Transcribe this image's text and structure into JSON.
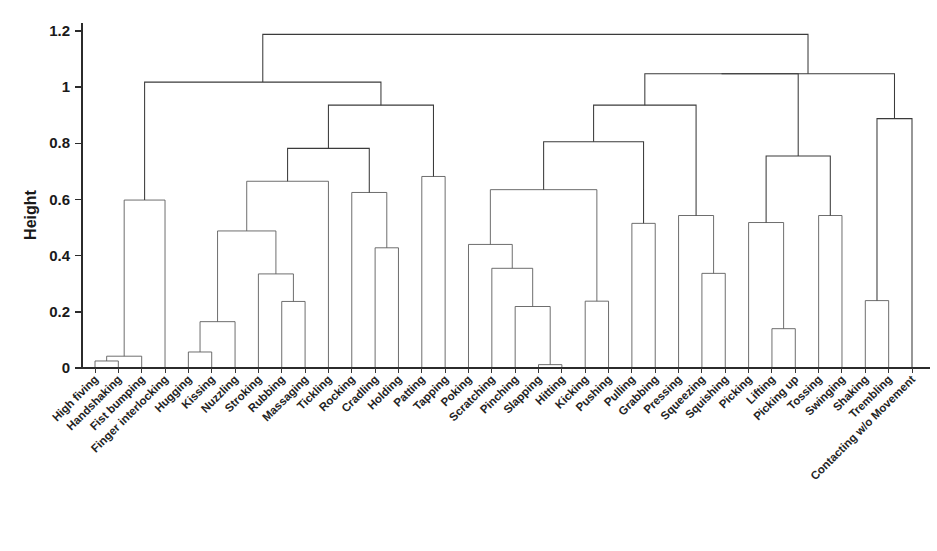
{
  "figure": {
    "background": "#ffffff",
    "line_color": "#5e5e5e",
    "text_color": "#1a1a1a"
  },
  "chart_data": {
    "type": "dendrogram",
    "title": "",
    "xlabel": "",
    "ylabel": "Height",
    "ylim": [
      0,
      1.28
    ],
    "yticks": [
      0,
      0.2,
      0.4,
      0.6,
      0.8,
      1,
      1.2
    ],
    "ytick_labels": [
      "0",
      "0.2",
      "0.4",
      "0.6",
      "0.8",
      "1",
      "1.2"
    ],
    "grid": false,
    "legend": "none",
    "leaf_rotation": 45,
    "leaves": [
      "High fiving",
      "Handshaking",
      "Fist bumping",
      "Finger interlocking",
      "Hugging",
      "Kissing",
      "Nuzzling",
      "Stroking",
      "Rubbing",
      "Massaging",
      "Tickling",
      "Rocking",
      "Cradling",
      "Holding",
      "Patting",
      "Tapping",
      "Poking",
      "Scratching",
      "Pinching",
      "Slapping",
      "Hitting",
      "Kicking",
      "Pushing",
      "Pulling",
      "Grabbing",
      "Pressing",
      "Squeezing",
      "Squishing",
      "Picking",
      "Lifting",
      "Picking up",
      "Tossing",
      "Swinging",
      "Shaking",
      "Trembling",
      "Contacting w/o Movement"
    ],
    "merges": [
      {
        "id": "m1",
        "left": "High fiving",
        "right": "Handshaking",
        "height": 0.025
      },
      {
        "id": "m2",
        "left": "m1",
        "right": "Fist bumping",
        "height": 0.042
      },
      {
        "id": "m3",
        "left": "m2",
        "right": "Finger interlocking",
        "height": 0.598
      },
      {
        "id": "m4",
        "left": "Hugging",
        "right": "Kissing",
        "height": 0.057
      },
      {
        "id": "m5",
        "left": "m4",
        "right": "Nuzzling",
        "height": 0.165
      },
      {
        "id": "m6",
        "left": "Rubbing",
        "right": "Massaging",
        "height": 0.237
      },
      {
        "id": "m7",
        "left": "Stroking",
        "right": "m6",
        "height": 0.335
      },
      {
        "id": "m8",
        "left": "m5",
        "right": "m7",
        "height": 0.488
      },
      {
        "id": "m9",
        "left": "m8",
        "right": "Tickling",
        "height": 0.665
      },
      {
        "id": "m10",
        "left": "Cradling",
        "right": "Holding",
        "height": 0.428
      },
      {
        "id": "m11",
        "left": "Rocking",
        "right": "m10",
        "height": 0.625
      },
      {
        "id": "m12",
        "left": "m9",
        "right": "m11",
        "height": 0.782
      },
      {
        "id": "m13",
        "left": "Patting",
        "right": "Tapping",
        "height": 0.682
      },
      {
        "id": "m14",
        "left": "m12",
        "right": "m13",
        "height": 0.936
      },
      {
        "id": "m15",
        "left": "m3",
        "right": "m14",
        "height": 1.018
      },
      {
        "id": "m16",
        "left": "Slapping",
        "right": "Hitting",
        "height": 0.012
      },
      {
        "id": "m17",
        "left": "Pinching",
        "right": "m16",
        "height": 0.219
      },
      {
        "id": "m18",
        "left": "Scratching",
        "right": "m17",
        "height": 0.355
      },
      {
        "id": "m19",
        "left": "Poking",
        "right": "m18",
        "height": 0.44
      },
      {
        "id": "m20",
        "left": "Kicking",
        "right": "Pushing",
        "height": 0.238
      },
      {
        "id": "m21",
        "left": "m19",
        "right": "m20",
        "height": 0.635
      },
      {
        "id": "m22",
        "left": "Pulling",
        "right": "Grabbing",
        "height": 0.515
      },
      {
        "id": "m23",
        "left": "m21",
        "right": "m22",
        "height": 0.806
      },
      {
        "id": "m24",
        "left": "Squeezing",
        "right": "Squishing",
        "height": 0.337
      },
      {
        "id": "m25",
        "left": "Pressing",
        "right": "m24",
        "height": 0.543
      },
      {
        "id": "m26",
        "left": "m23",
        "right": "m25",
        "height": 0.936
      },
      {
        "id": "m27",
        "left": "Lifting",
        "right": "Picking up",
        "height": 0.14
      },
      {
        "id": "m28",
        "left": "Picking",
        "right": "m27",
        "height": 0.518
      },
      {
        "id": "m29",
        "left": "Tossing",
        "right": "Swinging",
        "height": 0.543
      },
      {
        "id": "m30",
        "left": "m28",
        "right": "m29",
        "height": 0.755
      },
      {
        "id": "m31",
        "left": "m26",
        "right": "m30",
        "height": 1.048
      },
      {
        "id": "m32",
        "left": "Shaking",
        "right": "Trembling",
        "height": 0.24
      },
      {
        "id": "m33",
        "left": "m32",
        "right": "Contacting w/o Movement",
        "height": 0.888
      },
      {
        "id": "m34",
        "left": "m31",
        "right": "m33",
        "height": 1.048
      },
      {
        "id": "m35",
        "left": "m15",
        "right": "m34",
        "height": 1.188
      }
    ]
  }
}
